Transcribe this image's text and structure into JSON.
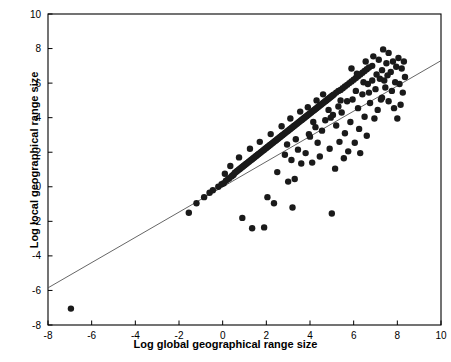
{
  "chart_data": {
    "type": "scatter",
    "title": "",
    "xlabel": "Log global geographical range size",
    "ylabel": "Log  local geographical range size",
    "xlim": [
      -8,
      10
    ],
    "ylim": [
      -8,
      10
    ],
    "xticks": [
      -8,
      -6,
      -4,
      -2,
      0,
      2,
      4,
      6,
      8,
      10
    ],
    "yticks": [
      -8,
      -6,
      -4,
      -2,
      0,
      2,
      4,
      6,
      8,
      10
    ],
    "grid": false,
    "legend": null,
    "colors": {
      "point": "#1a1a1a",
      "axis": "#000000",
      "line": "#555555"
    },
    "fit_line": {
      "type": "line",
      "x": [
        -8,
        10
      ],
      "y": [
        -5.85,
        7.3
      ],
      "slope": 0.73,
      "intercept": 0.0
    },
    "points": [
      [
        -6.95,
        -7.05
      ],
      [
        -1.55,
        -1.5
      ],
      [
        -1.2,
        -0.95
      ],
      [
        -0.85,
        -0.6
      ],
      [
        -0.6,
        -0.35
      ],
      [
        -0.45,
        -0.2
      ],
      [
        -0.2,
        0.0
      ],
      [
        -0.05,
        0.15
      ],
      [
        0.05,
        0.2
      ],
      [
        0.15,
        0.35
      ],
      [
        0.25,
        0.45
      ],
      [
        0.3,
        0.5
      ],
      [
        0.4,
        0.6
      ],
      [
        0.45,
        0.65
      ],
      [
        0.5,
        0.7
      ],
      [
        0.55,
        0.8
      ],
      [
        0.6,
        0.85
      ],
      [
        0.65,
        0.9
      ],
      [
        0.7,
        0.95
      ],
      [
        0.75,
        1.0
      ],
      [
        0.8,
        1.05
      ],
      [
        0.85,
        1.1
      ],
      [
        0.9,
        1.15
      ],
      [
        0.95,
        1.2
      ],
      [
        1.0,
        1.25
      ],
      [
        1.05,
        1.3
      ],
      [
        1.1,
        1.35
      ],
      [
        1.15,
        1.4
      ],
      [
        1.2,
        1.45
      ],
      [
        1.25,
        1.5
      ],
      [
        1.3,
        1.55
      ],
      [
        1.35,
        1.6
      ],
      [
        1.4,
        1.65
      ],
      [
        1.45,
        1.7
      ],
      [
        1.5,
        1.75
      ],
      [
        1.55,
        1.8
      ],
      [
        1.6,
        1.85
      ],
      [
        1.65,
        1.9
      ],
      [
        1.7,
        1.95
      ],
      [
        1.75,
        2.0
      ],
      [
        1.8,
        2.05
      ],
      [
        1.85,
        2.1
      ],
      [
        1.9,
        2.15
      ],
      [
        1.95,
        2.2
      ],
      [
        2.0,
        2.25
      ],
      [
        2.05,
        2.3
      ],
      [
        2.1,
        2.35
      ],
      [
        2.15,
        2.4
      ],
      [
        2.2,
        2.45
      ],
      [
        2.25,
        2.5
      ],
      [
        2.3,
        2.55
      ],
      [
        2.35,
        2.6
      ],
      [
        2.4,
        2.65
      ],
      [
        2.45,
        2.7
      ],
      [
        2.5,
        2.75
      ],
      [
        2.55,
        2.8
      ],
      [
        2.6,
        2.85
      ],
      [
        2.65,
        2.9
      ],
      [
        2.7,
        2.95
      ],
      [
        2.75,
        3.0
      ],
      [
        2.8,
        3.05
      ],
      [
        2.85,
        3.1
      ],
      [
        2.9,
        3.15
      ],
      [
        2.95,
        3.2
      ],
      [
        3.0,
        3.25
      ],
      [
        3.05,
        3.3
      ],
      [
        3.1,
        3.35
      ],
      [
        3.15,
        3.4
      ],
      [
        3.2,
        3.45
      ],
      [
        3.25,
        3.5
      ],
      [
        3.3,
        3.55
      ],
      [
        3.35,
        3.6
      ],
      [
        3.4,
        3.65
      ],
      [
        3.45,
        3.7
      ],
      [
        3.5,
        3.75
      ],
      [
        3.55,
        3.8
      ],
      [
        3.6,
        3.85
      ],
      [
        3.65,
        3.9
      ],
      [
        3.7,
        3.95
      ],
      [
        3.75,
        4.0
      ],
      [
        3.8,
        4.05
      ],
      [
        3.85,
        4.1
      ],
      [
        3.9,
        4.15
      ],
      [
        3.95,
        4.2
      ],
      [
        4.0,
        4.25
      ],
      [
        4.05,
        4.3
      ],
      [
        4.1,
        4.35
      ],
      [
        4.15,
        4.4
      ],
      [
        4.2,
        4.45
      ],
      [
        4.25,
        4.5
      ],
      [
        4.3,
        4.55
      ],
      [
        4.35,
        4.6
      ],
      [
        4.4,
        4.65
      ],
      [
        4.45,
        4.7
      ],
      [
        4.5,
        4.75
      ],
      [
        4.55,
        4.8
      ],
      [
        4.6,
        4.85
      ],
      [
        4.65,
        4.9
      ],
      [
        4.7,
        4.95
      ],
      [
        4.75,
        5.0
      ],
      [
        4.8,
        5.05
      ],
      [
        4.85,
        5.1
      ],
      [
        4.9,
        5.15
      ],
      [
        4.95,
        5.2
      ],
      [
        5.0,
        5.25
      ],
      [
        5.05,
        5.3
      ],
      [
        5.1,
        5.35
      ],
      [
        5.2,
        5.45
      ],
      [
        5.3,
        5.55
      ],
      [
        5.4,
        5.6
      ],
      [
        5.5,
        5.7
      ],
      [
        5.6,
        5.8
      ],
      [
        5.7,
        5.9
      ],
      [
        5.8,
        6.0
      ],
      [
        5.9,
        6.1
      ],
      [
        6.0,
        6.2
      ],
      [
        6.1,
        6.3
      ],
      [
        6.2,
        6.4
      ],
      [
        6.3,
        6.5
      ],
      [
        6.4,
        6.6
      ],
      [
        6.5,
        6.7
      ],
      [
        6.6,
        6.8
      ],
      [
        6.7,
        6.9
      ],
      [
        6.85,
        7.0
      ],
      [
        0.9,
        -1.8
      ],
      [
        1.35,
        -2.4
      ],
      [
        1.9,
        -2.35
      ],
      [
        2.35,
        -0.95
      ],
      [
        2.05,
        -0.6
      ],
      [
        3.2,
        -1.2
      ],
      [
        3.0,
        0.3
      ],
      [
        2.5,
        0.85
      ],
      [
        3.3,
        0.45
      ],
      [
        3.6,
        1.35
      ],
      [
        3.15,
        1.55
      ],
      [
        2.85,
        1.85
      ],
      [
        3.45,
        2.15
      ],
      [
        3.8,
        1.95
      ],
      [
        4.1,
        1.4
      ],
      [
        4.35,
        2.55
      ],
      [
        4.0,
        2.9
      ],
      [
        4.55,
        3.25
      ],
      [
        4.9,
        2.2
      ],
      [
        5.0,
        -1.55
      ],
      [
        5.15,
        1.05
      ],
      [
        5.35,
        2.6
      ],
      [
        5.6,
        3.1
      ],
      [
        5.2,
        3.55
      ],
      [
        4.7,
        3.85
      ],
      [
        5.45,
        4.3
      ],
      [
        5.85,
        3.75
      ],
      [
        6.05,
        2.55
      ],
      [
        6.25,
        3.35
      ],
      [
        6.5,
        4.05
      ],
      [
        6.2,
        4.55
      ],
      [
        5.95,
        5.05
      ],
      [
        6.4,
        5.35
      ],
      [
        6.75,
        4.85
      ],
      [
        6.95,
        3.95
      ],
      [
        7.1,
        4.45
      ],
      [
        7.3,
        5.15
      ],
      [
        7.0,
        5.65
      ],
      [
        6.65,
        5.95
      ],
      [
        7.2,
        6.25
      ],
      [
        7.45,
        5.75
      ],
      [
        7.6,
        4.95
      ],
      [
        7.75,
        5.55
      ],
      [
        7.9,
        6.05
      ],
      [
        7.55,
        6.45
      ],
      [
        7.3,
        6.75
      ],
      [
        7.05,
        6.5
      ],
      [
        6.85,
        6.15
      ],
      [
        7.7,
        6.65
      ],
      [
        7.95,
        6.95
      ],
      [
        7.5,
        7.15
      ],
      [
        7.15,
        7.35
      ],
      [
        6.9,
        7.55
      ],
      [
        7.6,
        7.75
      ],
      [
        7.35,
        7.95
      ],
      [
        8.05,
        7.45
      ],
      [
        8.2,
        6.85
      ],
      [
        8.35,
        6.35
      ],
      [
        8.1,
        5.95
      ],
      [
        8.25,
        5.45
      ],
      [
        7.85,
        4.55
      ],
      [
        8.0,
        3.95
      ],
      [
        8.15,
        4.75
      ],
      [
        6.6,
        2.95
      ],
      [
        6.3,
        1.95
      ],
      [
        5.75,
        2.05
      ],
      [
        5.55,
        1.65
      ],
      [
        4.45,
        1.75
      ],
      [
        4.25,
        3.45
      ],
      [
        3.95,
        3.05
      ],
      [
        5.05,
        4.15
      ],
      [
        5.3,
        4.65
      ],
      [
        4.85,
        4.45
      ],
      [
        6.1,
        5.55
      ],
      [
        5.7,
        4.95
      ],
      [
        6.45,
        6.05
      ],
      [
        6.15,
        6.55
      ],
      [
        5.9,
        6.85
      ],
      [
        6.55,
        7.25
      ],
      [
        7.8,
        7.25
      ],
      [
        8.3,
        7.25
      ],
      [
        4.6,
        5.35
      ],
      [
        4.3,
        5.0
      ],
      [
        3.9,
        4.6
      ],
      [
        3.55,
        4.35
      ],
      [
        3.1,
        3.95
      ],
      [
        2.7,
        3.5
      ],
      [
        2.2,
        3.05
      ],
      [
        1.7,
        2.6
      ],
      [
        1.25,
        2.2
      ],
      [
        0.75,
        1.7
      ],
      [
        0.35,
        1.2
      ],
      [
        0.1,
        0.75
      ],
      [
        2.95,
        2.45
      ],
      [
        3.35,
        2.75
      ],
      [
        4.15,
        3.75
      ],
      [
        4.95,
        4.0
      ],
      [
        5.4,
        5.0
      ],
      [
        6.7,
        5.45
      ],
      [
        7.25,
        5.05
      ],
      [
        7.4,
        6.15
      ]
    ]
  }
}
